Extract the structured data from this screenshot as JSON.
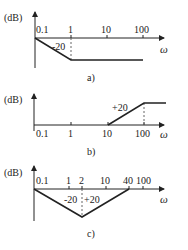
{
  "diagrams": [
    {
      "id": "a",
      "caption": "a)",
      "ylabel": "(dB)",
      "xlabel": "ω",
      "ticks": [
        "0.1",
        "1",
        "10",
        "100"
      ],
      "slope_labels": [
        "-20"
      ],
      "description": "Starts at 0 dB at 0.1, slopes -20 dB/dec to 1, then flat"
    },
    {
      "id": "b",
      "caption": "b)",
      "ylabel": "(dB)",
      "xlabel": "ω",
      "ticks": [
        "0.1",
        "1",
        "10",
        "100"
      ],
      "slope_labels": [
        "+20"
      ],
      "description": "Flat 0 dB until 10, slopes +20 dB/dec to 100, then flat"
    },
    {
      "id": "c",
      "caption": "c)",
      "ylabel": "(dB)",
      "xlabel": "ω",
      "ticks": [
        "0.1",
        "1",
        "2",
        "10",
        "40",
        "100"
      ],
      "slope_labels": [
        "-20",
        "+20"
      ],
      "description": "Slopes -20 dB/dec from 0.1 to 2, then +20 dB/dec back to 0 dB at 40"
    }
  ],
  "colors": {
    "line": "#222222",
    "dashed": "#666666"
  }
}
